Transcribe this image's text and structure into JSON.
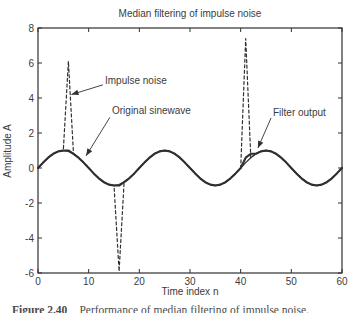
{
  "caption": {
    "number": "Figure 2.40",
    "text": "Performance of median filtering of impulse noise."
  },
  "chart_data": {
    "type": "line",
    "title": "Median filtering of impulse noise",
    "xlabel": "Time index n",
    "ylabel": "Amplitude A",
    "xlim": [
      0,
      60
    ],
    "ylim": [
      -6,
      8
    ],
    "xticks": [
      0,
      10,
      20,
      30,
      40,
      50,
      60
    ],
    "yticks": [
      -6,
      -4,
      -2,
      0,
      2,
      4,
      6,
      8
    ],
    "x_start": 0,
    "x_step": 1,
    "grid": false,
    "legend": "inline-annotations",
    "line_color": "#303030",
    "text_color": "#3c3c3c",
    "series": [
      {
        "name": "Impulse noise",
        "style": "dashed",
        "values": [
          0,
          0.31,
          0.59,
          0.81,
          0.95,
          1,
          6.1,
          0.81,
          0.59,
          0.31,
          0,
          -0.31,
          -0.59,
          -0.81,
          -0.95,
          -1,
          -5.9,
          -0.81,
          -0.59,
          -0.31,
          0,
          0.31,
          0.59,
          0.81,
          0.95,
          1,
          0.95,
          0.81,
          0.59,
          0.31,
          0,
          -0.31,
          -0.59,
          -0.81,
          -0.95,
          -1,
          -0.95,
          -0.81,
          -0.59,
          -0.31,
          0,
          7.4,
          0.59,
          0.81,
          0.95,
          1,
          0.95,
          0.81,
          0.59,
          0.31,
          0,
          -0.31,
          -0.59,
          -0.81,
          -0.95,
          -1,
          -0.95,
          -0.81,
          -0.59,
          -0.31,
          0
        ]
      },
      {
        "name": "Original sinewave",
        "style": "solid",
        "values": [
          0,
          0.31,
          0.59,
          0.81,
          0.95,
          1,
          0.95,
          0.81,
          0.59,
          0.31,
          0,
          -0.31,
          -0.59,
          -0.81,
          -0.95,
          -1,
          -0.95,
          -0.81,
          -0.59,
          -0.31,
          0,
          0.31,
          0.59,
          0.81,
          0.95,
          1,
          0.95,
          0.81,
          0.59,
          0.31,
          0,
          -0.31,
          -0.59,
          -0.81,
          -0.95,
          -1,
          -0.95,
          -0.81,
          -0.59,
          -0.31,
          0,
          0.31,
          0.59,
          0.81,
          0.95,
          1,
          0.95,
          0.81,
          0.59,
          0.31,
          0,
          -0.31,
          -0.59,
          -0.81,
          -0.95,
          -1,
          -0.95,
          -0.81,
          -0.59,
          -0.31,
          0
        ]
      },
      {
        "name": "Filter output",
        "style": "solid_thick",
        "values": [
          0,
          0.31,
          0.59,
          0.81,
          0.95,
          1,
          1,
          0.81,
          0.59,
          0.31,
          0,
          -0.31,
          -0.59,
          -0.81,
          -0.95,
          -1,
          -1,
          -0.81,
          -0.59,
          -0.31,
          0,
          0.31,
          0.59,
          0.81,
          0.95,
          1,
          0.95,
          0.81,
          0.59,
          0.31,
          0,
          -0.31,
          -0.59,
          -0.81,
          -0.95,
          -1,
          -0.95,
          -0.81,
          -0.59,
          -0.31,
          0,
          0.59,
          0.81,
          0.81,
          0.95,
          1,
          0.95,
          0.81,
          0.59,
          0.31,
          0,
          -0.31,
          -0.59,
          -0.81,
          -0.95,
          -1,
          -0.95,
          -0.81,
          -0.59,
          -0.31,
          0
        ]
      }
    ],
    "annotations": [
      {
        "label": "Impulse noise",
        "text_xy": [
          13.2,
          5.0
        ],
        "arrow_from": [
          12.8,
          4.75
        ],
        "arrow_to": [
          6.6,
          4.2
        ]
      },
      {
        "label": "Original sinewave",
        "text_xy": [
          14.6,
          3.26
        ],
        "arrow_from": [
          14.2,
          2.9
        ],
        "arrow_to": [
          9.5,
          0.7
        ]
      },
      {
        "label": "Filter output",
        "text_xy": [
          46.4,
          3.17
        ],
        "arrow_from": [
          46.0,
          2.86
        ],
        "arrow_to": [
          43.4,
          1.14
        ]
      }
    ]
  }
}
